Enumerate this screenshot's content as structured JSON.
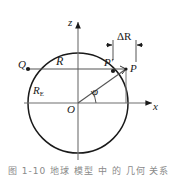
{
  "figure": {
    "kind": "geometry-diagram",
    "background_color": "#ffffff",
    "stroke_color": "#1a1a1a",
    "width_px": 169,
    "height_px": 175
  },
  "axes": {
    "vertical": {
      "label": "z",
      "direction": "up"
    },
    "horizontal": {
      "label": "x",
      "direction": "right"
    },
    "origin_label": "O"
  },
  "points": {
    "Q": {
      "label": "Q",
      "marker": "filled-dot"
    },
    "P_prime": {
      "label": "P′",
      "marker": "filled-dot"
    },
    "P": {
      "label": "P",
      "marker": "on-circle"
    }
  },
  "lengths": {
    "chord": {
      "label": "R"
    },
    "radius_base": {
      "label": "R",
      "subscript": "E"
    },
    "offset": {
      "label": "ΔR"
    }
  },
  "angle": {
    "label": "φ",
    "between": "x-axis and radius OP"
  },
  "caption": {
    "text": "图 1-10   地球 模型 中 的 几何 关系",
    "visibility": "cropped"
  }
}
